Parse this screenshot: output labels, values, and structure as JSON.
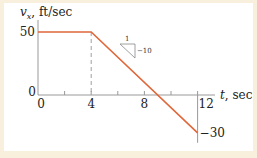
{
  "chart_data": {
    "type": "line",
    "title": "",
    "ylabel_var": "v",
    "ylabel_sub": "x",
    "ylabel_unit": ", ft/sec",
    "xlabel_var": "t",
    "xlabel_unit": ", sec",
    "x": [
      0,
      4,
      12
    ],
    "series": [
      {
        "name": "v_x",
        "values": [
          50,
          50,
          -30
        ],
        "color": "#e0673a"
      }
    ],
    "xlim": [
      0,
      12
    ],
    "ylim": [
      -30,
      50
    ],
    "x_ticks": [
      0,
      2,
      4,
      6,
      8,
      10,
      12
    ],
    "x_tick_labels": [
      {
        "value": 0,
        "label": "0"
      },
      {
        "value": 4,
        "label": "4"
      },
      {
        "value": 8,
        "label": "8"
      },
      {
        "value": 12,
        "label": "12"
      }
    ],
    "y_tick_labels": [
      {
        "value": 50,
        "label": "50"
      },
      {
        "value": 0,
        "label": "0"
      },
      {
        "value": -30,
        "label": "−30"
      }
    ],
    "dashed_reference_x": 4,
    "slope_annotation": {
      "run": "1",
      "rise": "−10"
    },
    "grid": false
  }
}
